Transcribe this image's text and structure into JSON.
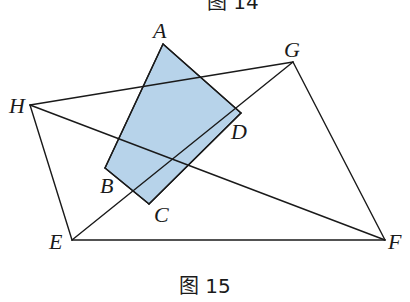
{
  "figure": {
    "caption": "图 15",
    "previous_caption_fragment": "图 14",
    "shaded_color": "#b7d3ea",
    "line_color": "#1a1a1a",
    "points": {
      "A": {
        "label": "A",
        "x": 163,
        "y": 44
      },
      "B": {
        "label": "B",
        "x": 105,
        "y": 168
      },
      "C": {
        "label": "C",
        "x": 149,
        "y": 204
      },
      "D": {
        "label": "D",
        "x": 241,
        "y": 113
      },
      "E": {
        "label": "E",
        "x": 72,
        "y": 240
      },
      "F": {
        "label": "F",
        "x": 385,
        "y": 240
      },
      "G": {
        "label": "G",
        "x": 293,
        "y": 62
      },
      "H": {
        "label": "H",
        "x": 30,
        "y": 105
      }
    },
    "shaded_quadrilateral": [
      "A",
      "B",
      "C",
      "D"
    ],
    "segments": [
      [
        "H",
        "G"
      ],
      [
        "H",
        "E"
      ],
      [
        "E",
        "F"
      ],
      [
        "G",
        "F"
      ],
      [
        "E",
        "G"
      ],
      [
        "H",
        "F"
      ],
      [
        "A",
        "B"
      ],
      [
        "B",
        "C"
      ],
      [
        "C",
        "D"
      ],
      [
        "A",
        "D"
      ]
    ]
  }
}
